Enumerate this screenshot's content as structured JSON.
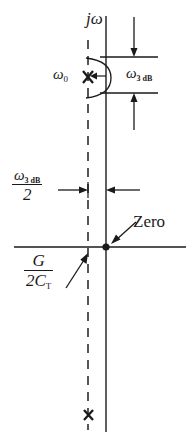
{
  "figure": {
    "type": "pole-zero-plot",
    "title": "",
    "plane": "s-plane",
    "axes": {
      "vertical_label": "jω",
      "horizontal_label": "σ",
      "origin_px": [
        106,
        247
      ]
    },
    "labels": {
      "omega_zero": "ω",
      "omega_zero_sub": "0",
      "omega_3db": "ω",
      "omega_3db_sub": "3 dB",
      "zero": "Zero",
      "half_omega_num_sym": "ω",
      "half_omega_num_sub": "3 dB",
      "half_omega_den": "2",
      "sigma_num": "G",
      "sigma_den_lead": "2C",
      "sigma_den_sub": "T",
      "j_omega": "jω"
    },
    "markers": [
      {
        "name": "pole-upper",
        "symbol": "x",
        "x": 88,
        "y": 78,
        "label": "ω0"
      },
      {
        "name": "pole-lower",
        "symbol": "x",
        "x": 88,
        "y": 415,
        "label": ""
      },
      {
        "name": "zero-origin",
        "symbol": "dot",
        "x": 106,
        "y": 247,
        "label": "Zero"
      }
    ],
    "guides": {
      "dashed_line_x": 88,
      "jw_axis_x": 106,
      "sigma_axis_y": 247,
      "bandwidth_top_y": 57,
      "bandwidth_bottom_y": 93
    },
    "colors": {
      "ink": "#1a1a1a",
      "dash": "#555555",
      "background": "#ffffff"
    }
  }
}
